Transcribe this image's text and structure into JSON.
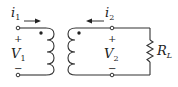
{
  "diagram": {
    "type": "transformer-circuit",
    "primary": {
      "current_label": "i",
      "current_sub": "1",
      "voltage_label": "V",
      "voltage_sub": "1",
      "plus": "+",
      "minus": "−"
    },
    "secondary": {
      "current_label": "i",
      "current_sub": "2",
      "voltage_label": "V",
      "voltage_sub": "2",
      "plus": "+",
      "minus": "−"
    },
    "load": {
      "label": "R",
      "label_sub": "L"
    },
    "colors": {
      "wire": "#333333",
      "text": "#222222",
      "background": "#ffffff"
    }
  }
}
